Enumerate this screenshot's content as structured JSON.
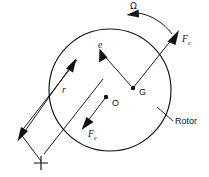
{
  "figure": {
    "type": "engineering-vector-diagram",
    "background_color": "#ffffff",
    "line_color": "#111111"
  },
  "labels": {
    "omega": "Ω",
    "force_centrifugal_base": "F",
    "force_centrifugal_sub": "c",
    "force_eccentric_base": "F",
    "force_eccentric_sub": "e",
    "eccentricity": "e",
    "radius": "r",
    "center_of_gravity": "G",
    "geometric_center": "O",
    "rotor": "Rotor"
  },
  "points": {
    "geometric_center": {
      "x": 106,
      "y": 97,
      "label": "O"
    },
    "center_of_gravity": {
      "x": 133,
      "y": 88,
      "label": "G"
    },
    "mass_marker": {
      "x": 41,
      "y": 163,
      "label": "+"
    }
  },
  "circle": {
    "cx": 110,
    "cy": 90,
    "r": 61,
    "name": "rotor-body"
  },
  "vectors": [
    {
      "name": "eccentricity-vector",
      "symbol": "e",
      "from": "G",
      "to": "upper-left",
      "arrow": true
    },
    {
      "name": "radius-vector",
      "symbol": "r",
      "from": "mass-marker",
      "to": "upper-right",
      "arrow": true
    },
    {
      "name": "centrifugal-force-vector",
      "symbol": "Fc",
      "from": "G",
      "to": "upper-right-outside-circle",
      "arrow": true
    },
    {
      "name": "eccentric-force-vector",
      "symbol": "Fe",
      "from": "O",
      "to": "lower-left",
      "arrow": true
    },
    {
      "name": "rotation-arrow",
      "symbol": "Ω",
      "direction": "counterclockwise-leftward",
      "arrow": true
    }
  ]
}
